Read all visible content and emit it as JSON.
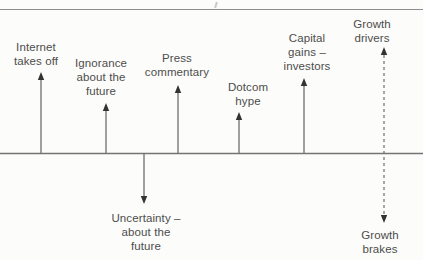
{
  "figure": {
    "type": "driver-brake-arrow-diagram",
    "colors": {
      "background": "#fcfcfa",
      "baseline": "#737373",
      "top_rule": "#8d8d8d",
      "arrow_stem": "#6e6e6e",
      "arrow_head": "#333333",
      "text": "#4d4d4d"
    }
  },
  "diagram": {
    "drivers_above_line": [
      {
        "label": "Internet\ntakes off"
      },
      {
        "label": "Ignorance\nabout the\nfuture"
      },
      {
        "label": "Press\ncommentary"
      },
      {
        "label": "Dotcom\nhype"
      },
      {
        "label": "Capital\ngains –\ninvestors"
      }
    ],
    "brakes_below_line": [
      {
        "label": "Uncertainty –\nabout the\nfuture"
      }
    ],
    "axis_legend": {
      "up_label": "Growth\ndrivers",
      "down_label": "Growth\nbrakes"
    }
  }
}
